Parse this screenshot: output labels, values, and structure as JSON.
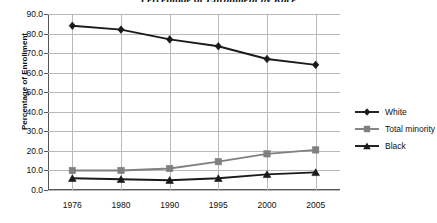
{
  "chart_data": {
    "type": "line",
    "title": "Percentage of Enrollment by Race",
    "xlabel": "",
    "ylabel": "Percentage of Enrollment",
    "categories": [
      "1976",
      "1980",
      "1990",
      "1995",
      "2000",
      "2005"
    ],
    "ylim": [
      0,
      90
    ],
    "ytick_labels": [
      "90.0",
      "80.0",
      "70.0",
      "60.0",
      "50.0",
      "40.0",
      "30.0",
      "20.0",
      "10.0",
      "0.0"
    ],
    "ytick_values": [
      90,
      80,
      70,
      60,
      50,
      40,
      30,
      20,
      10,
      0
    ],
    "grid": true,
    "legend_position": "right",
    "series": [
      {
        "name": "White",
        "values": [
          84.0,
          82.0,
          77.0,
          73.5,
          67.0,
          64.0
        ],
        "marker": "diamond",
        "color": "#1a1a1a"
      },
      {
        "name": "Total minority",
        "values": [
          10.0,
          10.0,
          11.0,
          14.5,
          18.5,
          20.5
        ],
        "marker": "square",
        "color": "#808080"
      },
      {
        "name": "Black",
        "values": [
          6.0,
          5.5,
          5.0,
          6.0,
          8.0,
          9.0
        ],
        "marker": "triangle",
        "color": "#1a1a1a"
      }
    ]
  },
  "legend": {
    "items": [
      {
        "label": "White"
      },
      {
        "label": "Total minority"
      },
      {
        "label": "Black"
      }
    ]
  },
  "colors": {
    "white_series": "#1a1a1a",
    "minority_series": "#808080",
    "black_series": "#1a1a1a",
    "gridline": "#b9b9b9",
    "axis": "#555555",
    "background": "#ffffff"
  }
}
